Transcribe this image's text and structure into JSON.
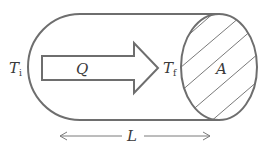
{
  "diagram": {
    "labels": {
      "initial_temp": "T",
      "initial_temp_sub": "i",
      "final_temp": "T",
      "final_temp_sub": "f",
      "heat": "Q",
      "area": "A",
      "length": "L"
    },
    "colors": {
      "stroke": "#6e6e6e",
      "hatch": "#7a7a7a",
      "text": "#3a3a3a",
      "background": "#ffffff"
    }
  }
}
